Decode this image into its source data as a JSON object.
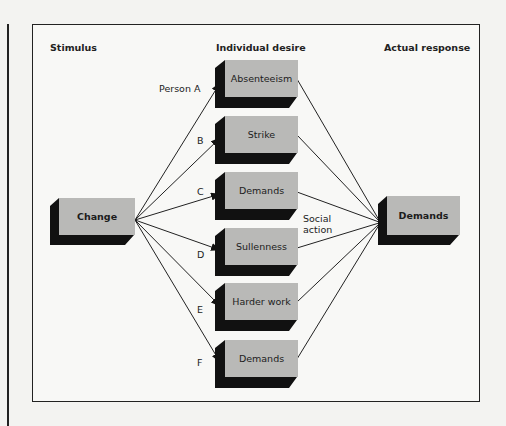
{
  "headers": {
    "stimulus": "Stimulus",
    "individual_desire": "Individual desire",
    "actual_response": "Actual response"
  },
  "stimulus_box": {
    "label": "Change"
  },
  "response_box": {
    "label": "Demands"
  },
  "persons": [
    {
      "label": "Person  A",
      "desire": "Absenteeism"
    },
    {
      "label": "B",
      "desire": "Strike"
    },
    {
      "label": "C",
      "desire": "Demands"
    },
    {
      "label": "D",
      "desire": "Sullenness"
    },
    {
      "label": "E",
      "desire": "Harder work"
    },
    {
      "label": "F",
      "desire": "Demands"
    }
  ],
  "annotation": {
    "line1": "Social",
    "line2": "action"
  },
  "colors": {
    "box_face": "#b9b9b7",
    "box_shadow": "#111111",
    "line": "#222222"
  }
}
